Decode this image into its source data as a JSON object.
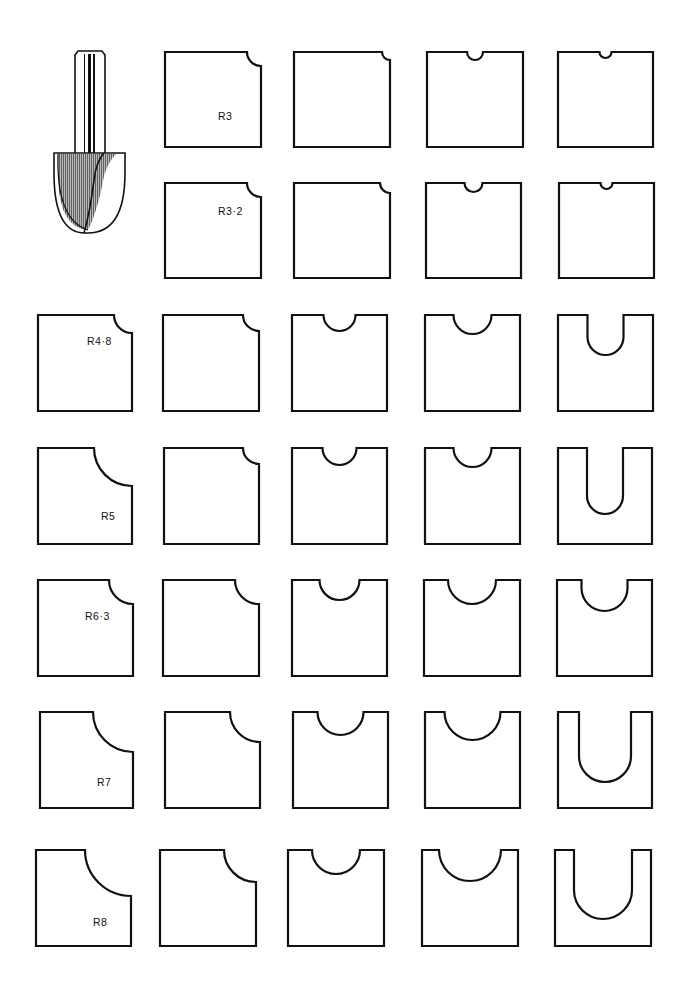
{
  "figure": {
    "title": ""
  },
  "cutter": {
    "name": "core-box-router-bit",
    "shade_color": "#555555",
    "stroke_color": "#111111"
  },
  "colors": {
    "ink": "#111111",
    "background": "#ffffff"
  },
  "rows": [
    {
      "radius_label": "R3",
      "radius": 3,
      "y": 52,
      "h": 95,
      "panels": [
        {
          "col": 1,
          "x": 165,
          "w": 96,
          "cut": "corner",
          "r": 14,
          "label_dx": 52,
          "label_dy": 58
        },
        {
          "col": 2,
          "x": 294,
          "w": 96,
          "cut": "corner",
          "r": 8
        },
        {
          "col": 3,
          "x": 427,
          "w": 96,
          "cut": "top-notch",
          "r": 8,
          "cx": 0.5
        },
        {
          "col": 4,
          "x": 558,
          "w": 95,
          "cut": "top-notch",
          "r": 6,
          "cx": 0.5
        }
      ]
    },
    {
      "radius_label": "R3·2",
      "radius": 3.2,
      "y": 183,
      "h": 95,
      "panels": [
        {
          "col": 1,
          "x": 165,
          "w": 96,
          "cut": "corner",
          "r": 14,
          "label_dx": 52,
          "label_dy": 22
        },
        {
          "col": 2,
          "x": 294,
          "w": 96,
          "cut": "corner",
          "r": 10
        },
        {
          "col": 3,
          "x": 426,
          "w": 95,
          "cut": "top-notch",
          "r": 9,
          "cx": 0.5
        },
        {
          "col": 4,
          "x": 559,
          "w": 95,
          "cut": "top-notch",
          "r": 6,
          "cx": 0.5
        }
      ]
    },
    {
      "radius_label": "R4·8",
      "radius": 4.8,
      "y": 315,
      "h": 96,
      "panels": [
        {
          "col": 0,
          "x": 38,
          "w": 94,
          "cut": "corner",
          "r": 18,
          "label_dx": 48,
          "label_dy": 20
        },
        {
          "col": 1,
          "x": 163,
          "w": 96,
          "cut": "corner",
          "r": 16
        },
        {
          "col": 2,
          "x": 292,
          "w": 95,
          "cut": "top-notch",
          "r": 16,
          "cx": 0.5
        },
        {
          "col": 3,
          "x": 425,
          "w": 95,
          "cut": "top-notch",
          "r": 19,
          "cx": 0.5
        },
        {
          "col": 4,
          "x": 558,
          "w": 95,
          "cut": "u-slot",
          "r": 18,
          "depth": 22,
          "cx": 0.5
        }
      ]
    },
    {
      "radius_label": "R5",
      "radius": 5,
      "y": 448,
      "h": 96,
      "panels": [
        {
          "col": 0,
          "x": 38,
          "w": 94,
          "cut": "corner",
          "r": 38,
          "label_dx": 62,
          "label_dy": 62
        },
        {
          "col": 1,
          "x": 164,
          "w": 95,
          "cut": "corner",
          "r": 16
        },
        {
          "col": 2,
          "x": 292,
          "w": 95,
          "cut": "top-notch",
          "r": 17,
          "cx": 0.5
        },
        {
          "col": 3,
          "x": 425,
          "w": 95,
          "cut": "top-notch",
          "r": 19,
          "cx": 0.5
        },
        {
          "col": 4,
          "x": 558,
          "w": 94,
          "cut": "u-slot",
          "r": 18,
          "depth": 48,
          "cx": 0.5
        }
      ]
    },
    {
      "radius_label": "R6·3",
      "radius": 6.3,
      "y": 580,
      "h": 96,
      "panels": [
        {
          "col": 0,
          "x": 38,
          "w": 95,
          "cut": "corner",
          "r": 24,
          "label_dx": 46,
          "label_dy": 30
        },
        {
          "col": 1,
          "x": 163,
          "w": 96,
          "cut": "corner",
          "r": 24
        },
        {
          "col": 2,
          "x": 292,
          "w": 95,
          "cut": "top-notch",
          "r": 20,
          "cx": 0.5
        },
        {
          "col": 3,
          "x": 424,
          "w": 96,
          "cut": "top-notch",
          "r": 24,
          "cx": 0.5
        },
        {
          "col": 4,
          "x": 557,
          "w": 95,
          "cut": "u-slot",
          "r": 23,
          "depth": 8,
          "cx": 0.5
        }
      ]
    },
    {
      "radius_label": "R7",
      "radius": 7,
      "y": 712,
      "h": 96,
      "panels": [
        {
          "col": 0,
          "x": 40,
          "w": 93,
          "cut": "corner",
          "r": 40,
          "label_dx": 56,
          "label_dy": 64
        },
        {
          "col": 1,
          "x": 165,
          "w": 95,
          "cut": "corner",
          "r": 30
        },
        {
          "col": 2,
          "x": 293,
          "w": 95,
          "cut": "top-notch",
          "r": 23,
          "cx": 0.5
        },
        {
          "col": 3,
          "x": 425,
          "w": 95,
          "cut": "top-notch",
          "r": 28,
          "cx": 0.5
        },
        {
          "col": 4,
          "x": 558,
          "w": 94,
          "cut": "u-slot",
          "r": 26,
          "depth": 44,
          "cx": 0.5
        }
      ]
    },
    {
      "radius_label": "R8",
      "radius": 8,
      "y": 850,
      "h": 96,
      "panels": [
        {
          "col": 0,
          "x": 36,
          "w": 95,
          "cut": "corner",
          "r": 46,
          "label_dx": 56,
          "label_dy": 66
        },
        {
          "col": 1,
          "x": 160,
          "w": 96,
          "cut": "corner",
          "r": 32
        },
        {
          "col": 2,
          "x": 288,
          "w": 96,
          "cut": "top-notch",
          "r": 24,
          "cx": 0.5
        },
        {
          "col": 3,
          "x": 422,
          "w": 96,
          "cut": "top-notch",
          "r": 31,
          "cx": 0.5
        },
        {
          "col": 4,
          "x": 555,
          "w": 96,
          "cut": "u-slot",
          "r": 29,
          "depth": 40,
          "cx": 0.5
        }
      ]
    }
  ]
}
